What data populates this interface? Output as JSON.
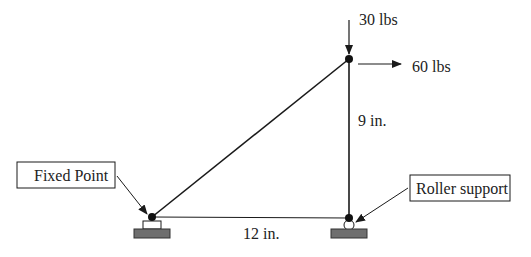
{
  "diagram": {
    "nodes": {
      "top": {
        "x": 349,
        "y": 59
      },
      "fixed": {
        "x": 152,
        "y": 217
      },
      "roller": {
        "x": 349,
        "y": 218
      }
    },
    "members": [
      {
        "from": "fixed",
        "to": "top"
      },
      {
        "from": "top",
        "to": "roller"
      },
      {
        "from": "fixed",
        "to": "roller"
      }
    ],
    "loads": {
      "vertical": {
        "label": "30 lbs",
        "direction": "down"
      },
      "horizontal": {
        "label": "60 lbs",
        "direction": "right"
      }
    },
    "dimensions": {
      "vertical": {
        "label": "9 in."
      },
      "horizontal": {
        "label": "12 in."
      }
    },
    "callouts": {
      "fixed": {
        "label": "Fixed Point"
      },
      "roller": {
        "label": "Roller support"
      }
    },
    "colors": {
      "line": "#1a1a1a",
      "node": "#111111",
      "ground": "#6e6e6e",
      "text": "#222222",
      "background": "#ffffff"
    }
  }
}
